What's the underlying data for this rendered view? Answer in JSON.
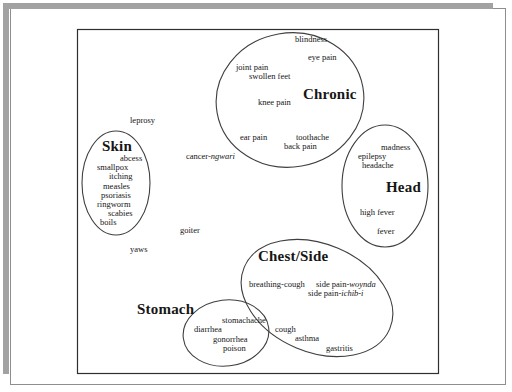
{
  "canvas": {
    "width": 512,
    "height": 392,
    "background": "#ffffff"
  },
  "style": {
    "text_color": "#161616",
    "ellipse_stroke": "#3f3f3f",
    "plot_box_stroke": "#2f2f2f",
    "shadow_bar_color": "#a2a2a2",
    "page_border_color": "#8e8e8e"
  },
  "frame": {
    "top_bar": {
      "x": 4,
      "y": 3,
      "w": 489,
      "h": 6
    },
    "left_bar": {
      "x": 3,
      "y": 3,
      "w": 6,
      "h": 371
    },
    "page_border": {
      "x": 10,
      "y": 8,
      "w": 495,
      "h": 376
    },
    "plot_box": {
      "x": 77,
      "y": 29,
      "w": 361,
      "h": 344
    }
  },
  "clusters": [
    {
      "name": "chronic",
      "label": {
        "text": "Chronic",
        "x": 303,
        "y": 87
      },
      "ellipse": {
        "cx": 290,
        "cy": 100,
        "rx": 74,
        "ry": 67,
        "rotate": -10
      },
      "terms": [
        {
          "text": "blindness",
          "x": 295,
          "y": 35
        },
        {
          "text": "eye pain",
          "x": 308,
          "y": 53
        },
        {
          "text": "joint pain",
          "x": 236,
          "y": 63
        },
        {
          "text": "swollen feet",
          "x": 249,
          "y": 72
        },
        {
          "text": "knee pain",
          "x": 258,
          "y": 98
        },
        {
          "text": "ear pain",
          "x": 240,
          "y": 133
        },
        {
          "text": "toothache",
          "x": 296,
          "y": 133
        },
        {
          "text": "back pain",
          "x": 284,
          "y": 142
        }
      ]
    },
    {
      "name": "skin",
      "label": {
        "text": "Skin",
        "x": 102,
        "y": 139
      },
      "ellipse": {
        "cx": 116,
        "cy": 183,
        "rx": 34,
        "ry": 52,
        "rotate": 0
      },
      "terms": [
        {
          "text": "abcess",
          "x": 120,
          "y": 154
        },
        {
          "text": "smallpox",
          "x": 97,
          "y": 163
        },
        {
          "text": "itching",
          "x": 109,
          "y": 172
        },
        {
          "text": "measles",
          "x": 103,
          "y": 182
        },
        {
          "text": "psoriasis",
          "x": 101,
          "y": 191
        },
        {
          "text": "ringworm",
          "x": 97,
          "y": 200
        },
        {
          "text": "scabies",
          "x": 108,
          "y": 209
        },
        {
          "text": "boils",
          "x": 100,
          "y": 218
        }
      ]
    },
    {
      "name": "head",
      "label": {
        "text": "Head",
        "x": 386,
        "y": 180
      },
      "ellipse": {
        "cx": 385,
        "cy": 186,
        "rx": 43,
        "ry": 61,
        "rotate": 0
      },
      "terms": [
        {
          "text": "madness",
          "x": 381,
          "y": 143
        },
        {
          "text": "epilepsy",
          "x": 358,
          "y": 152
        },
        {
          "text": "headache",
          "x": 362,
          "y": 161
        },
        {
          "text": "high fever",
          "x": 360,
          "y": 208
        },
        {
          "text": "fever",
          "x": 377,
          "y": 227
        }
      ]
    },
    {
      "name": "chest-side",
      "label": {
        "text": "Chest/Side",
        "x": 258,
        "y": 249
      },
      "ellipse": {
        "cx": 317,
        "cy": 298,
        "rx": 79,
        "ry": 54,
        "rotate": 23
      },
      "terms": [
        {
          "text": "breathing-cough",
          "x": 249,
          "y": 280
        },
        {
          "text": "side pain-",
          "italic": "woynda",
          "x": 316,
          "y": 280
        },
        {
          "text": "side pain-",
          "italic": "ichib-i",
          "x": 308,
          "y": 289
        },
        {
          "text": "cough",
          "x": 275,
          "y": 325
        },
        {
          "text": "asthma",
          "x": 295,
          "y": 334
        },
        {
          "text": "gastritis",
          "x": 326,
          "y": 344
        }
      ]
    },
    {
      "name": "stomach",
      "label": {
        "text": "Stomach",
        "x": 137,
        "y": 302
      },
      "ellipse": {
        "cx": 226,
        "cy": 333,
        "rx": 43,
        "ry": 33,
        "rotate": -7
      },
      "terms": [
        {
          "text": "stomachache",
          "x": 222,
          "y": 316
        },
        {
          "text": "diarrhea",
          "x": 194,
          "y": 325
        },
        {
          "text": "gonorrhea",
          "x": 213,
          "y": 335
        },
        {
          "text": "poison",
          "x": 223,
          "y": 344
        }
      ]
    }
  ],
  "unclustered_terms": [
    {
      "text": "leprosy",
      "x": 130,
      "y": 116
    },
    {
      "text": "cancer-",
      "italic": "ngwari",
      "x": 186,
      "y": 152
    },
    {
      "text": "goiter",
      "x": 180,
      "y": 226
    },
    {
      "text": "yaws",
      "x": 130,
      "y": 245
    }
  ]
}
